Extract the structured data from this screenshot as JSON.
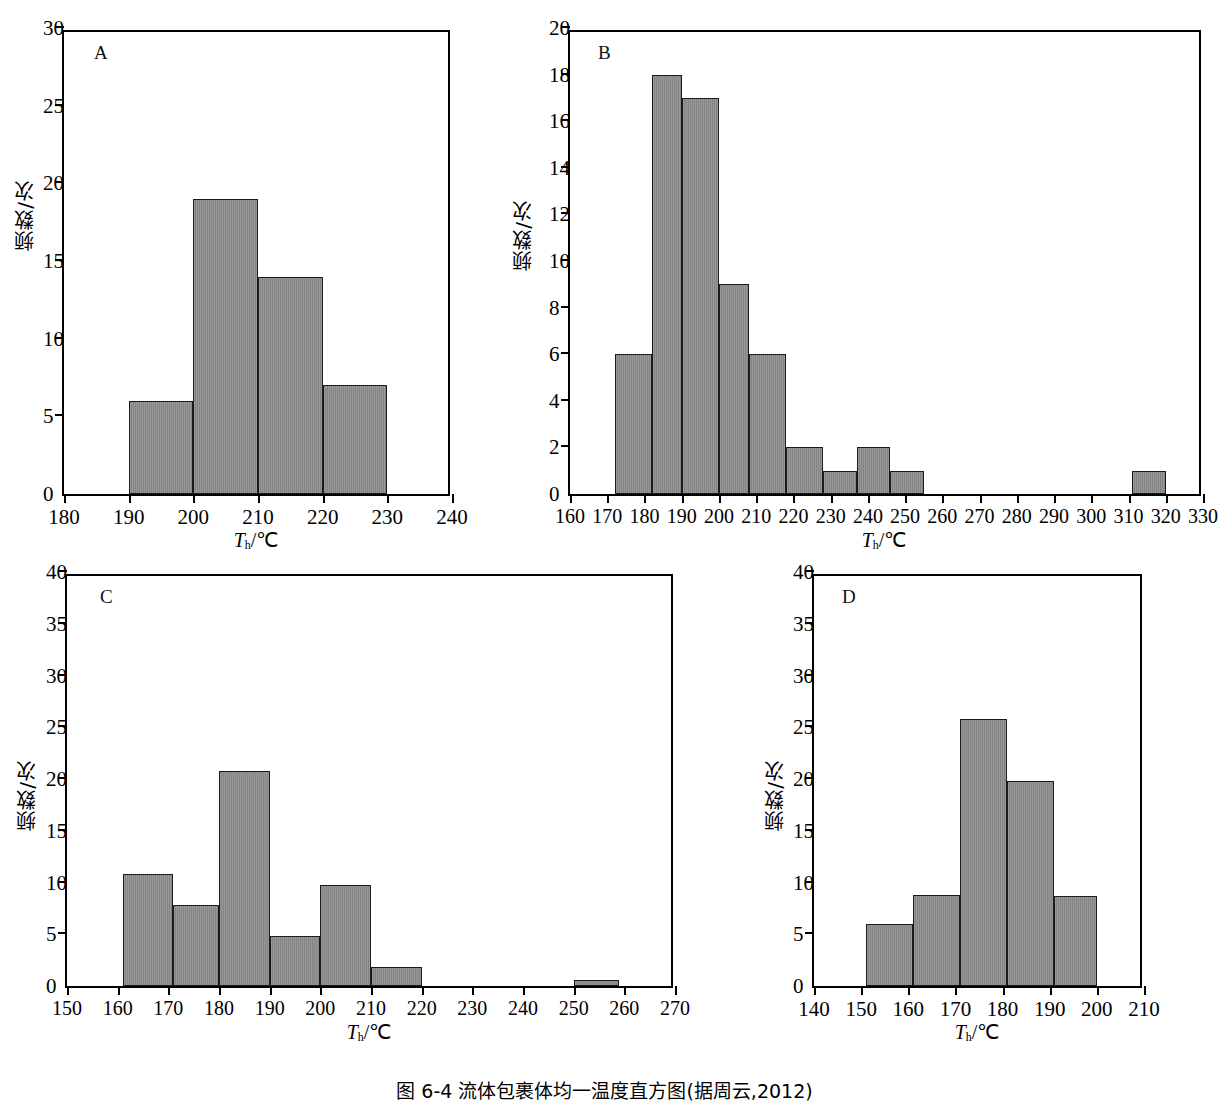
{
  "figure": {
    "caption": "图 6-4  流体包裹体均一温度直方图(据周云,2012)",
    "axis_label_x": "T h /℃",
    "axis_label_y": "频数/次"
  },
  "chart_data": [
    {
      "type": "bar",
      "panel": "A",
      "title": "",
      "xlabel": "Th/℃",
      "ylabel": "频数/次",
      "xlim": [
        180,
        240
      ],
      "ylim": [
        0,
        30
      ],
      "xticks": [
        180,
        190,
        200,
        210,
        220,
        230,
        240
      ],
      "yticks": [
        0,
        5,
        10,
        15,
        20,
        25,
        30
      ],
      "bin_width": 10,
      "grid": false,
      "legend": "none",
      "bins": [
        {
          "start": 190,
          "end": 200,
          "value": 6
        },
        {
          "start": 200,
          "end": 210,
          "value": 19
        },
        {
          "start": 210,
          "end": 220,
          "value": 14
        },
        {
          "start": 220,
          "end": 230,
          "value": 7
        }
      ]
    },
    {
      "type": "bar",
      "panel": "B",
      "title": "",
      "xlabel": "Th/℃",
      "ylabel": "频数/次",
      "xlim": [
        160,
        330
      ],
      "ylim": [
        0,
        20
      ],
      "xticks": [
        160,
        170,
        180,
        190,
        200,
        210,
        220,
        230,
        240,
        250,
        260,
        270,
        280,
        290,
        300,
        310,
        320,
        330
      ],
      "yticks": [
        0,
        2,
        4,
        6,
        8,
        10,
        12,
        14,
        16,
        18,
        20
      ],
      "bin_width": 10,
      "grid": false,
      "legend": "none",
      "bins": [
        {
          "start": 172,
          "end": 182,
          "value": 6
        },
        {
          "start": 182,
          "end": 190,
          "value": 18
        },
        {
          "start": 190,
          "end": 200,
          "value": 17
        },
        {
          "start": 200,
          "end": 208,
          "value": 9
        },
        {
          "start": 208,
          "end": 218,
          "value": 6
        },
        {
          "start": 218,
          "end": 228,
          "value": 2
        },
        {
          "start": 228,
          "end": 237,
          "value": 1
        },
        {
          "start": 237,
          "end": 246,
          "value": 2
        },
        {
          "start": 246,
          "end": 255,
          "value": 1
        },
        {
          "start": 311,
          "end": 320,
          "value": 1
        }
      ]
    },
    {
      "type": "bar",
      "panel": "C",
      "title": "",
      "xlabel": "Th/℃",
      "ylabel": "频数/次",
      "xlim": [
        150,
        270
      ],
      "ylim": [
        0,
        40
      ],
      "xticks": [
        150,
        160,
        170,
        180,
        190,
        200,
        210,
        220,
        230,
        240,
        250,
        260,
        270
      ],
      "yticks": [
        0,
        5,
        10,
        15,
        20,
        25,
        30,
        35,
        40
      ],
      "bin_width": 10,
      "grid": false,
      "legend": "none",
      "bins": [
        {
          "start": 161,
          "end": 171,
          "value": 10.8
        },
        {
          "start": 171,
          "end": 180,
          "value": 7.8
        },
        {
          "start": 180,
          "end": 190,
          "value": 20.8
        },
        {
          "start": 190,
          "end": 200,
          "value": 4.8
        },
        {
          "start": 200,
          "end": 210,
          "value": 9.8
        },
        {
          "start": 210,
          "end": 220,
          "value": 1.8
        },
        {
          "start": 250,
          "end": 259,
          "value": 0.6
        }
      ]
    },
    {
      "type": "bar",
      "panel": "D",
      "title": "",
      "xlabel": "Th/℃",
      "ylabel": "频数/次",
      "xlim": [
        140,
        210
      ],
      "ylim": [
        0,
        40
      ],
      "xticks": [
        140,
        150,
        160,
        170,
        180,
        190,
        200,
        210
      ],
      "yticks": [
        0,
        5,
        10,
        15,
        20,
        25,
        30,
        35,
        40
      ],
      "bin_width": 10,
      "grid": false,
      "legend": "none",
      "bins": [
        {
          "start": 151,
          "end": 161,
          "value": 6
        },
        {
          "start": 161,
          "end": 171,
          "value": 8.8
        },
        {
          "start": 171,
          "end": 181,
          "value": 25.8
        },
        {
          "start": 181,
          "end": 191,
          "value": 19.8
        },
        {
          "start": 191,
          "end": 200,
          "value": 8.7
        }
      ]
    }
  ],
  "panels": {
    "A": {
      "letter": "A"
    },
    "B": {
      "letter": "B"
    },
    "C": {
      "letter": "C"
    },
    "D": {
      "letter": "D"
    }
  },
  "style": {
    "bar_fill": "#8b8b8b",
    "bar_stroke": "#1a1a1a",
    "axis_color": "#000000",
    "background": "#ffffff"
  }
}
